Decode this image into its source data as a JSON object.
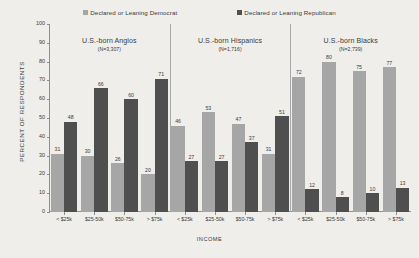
{
  "chart_data": {
    "type": "bar",
    "title": "",
    "xlabel": "INCOME",
    "ylabel": "PERCENT OF RESPONDENTS",
    "ylim": [
      0,
      100
    ],
    "yticks": [
      0,
      10,
      20,
      30,
      40,
      50,
      60,
      70,
      80,
      90,
      100
    ],
    "grid": false,
    "legend_position": "top",
    "categories": [
      "< $25k",
      "$25-50k",
      "$50-75k",
      "> $75k"
    ],
    "legend": [
      {
        "name": "Declared or Leaning Democrat",
        "color": "#a6a6a6"
      },
      {
        "name": "Declared or Leaning Republican",
        "color": "#4f4f4f"
      }
    ],
    "panels": [
      {
        "title": "U.S.-born Anglos",
        "subtitle": "(N=3,307)",
        "categories": [
          "< $25k",
          "$25-50k",
          "$50-75k",
          "> $75k"
        ],
        "series": [
          {
            "name": "Declared or Leaning Democrat",
            "values": [
              31,
              30,
              26,
              20
            ]
          },
          {
            "name": "Declared or Leaning Republican",
            "values": [
              48,
              66,
              60,
              71
            ]
          }
        ]
      },
      {
        "title": "U.S.-born Hispanics",
        "subtitle": "(N=1,716)",
        "categories": [
          "< $25k",
          "$25-50k",
          "$50-75k",
          "> $75k"
        ],
        "series": [
          {
            "name": "Declared or Leaning Democrat",
            "values": [
              46,
              53,
              47,
              31
            ]
          },
          {
            "name": "Declared or Leaning Republican",
            "values": [
              27,
              27,
              37,
              51
            ]
          }
        ]
      },
      {
        "title": "U.S.-born Blacks",
        "subtitle": "(N=2,739)",
        "categories": [
          "< $25k",
          "$25-50k",
          "$50-75k",
          "> $75k"
        ],
        "series": [
          {
            "name": "Declared or Leaning Democrat",
            "values": [
              72,
              80,
              75,
              77
            ]
          },
          {
            "name": "Declared or Leaning Republican",
            "values": [
              12,
              8,
              10,
              13
            ]
          }
        ]
      }
    ]
  }
}
